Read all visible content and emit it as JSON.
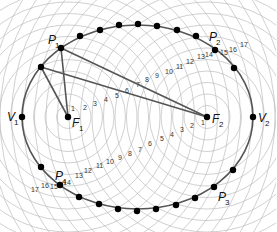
{
  "diagram": {
    "colors": {
      "circles": "#bcbcbc",
      "ellipse": "#555555",
      "lines": "#555555",
      "points": "#000000",
      "text": "#222222"
    },
    "ellipse": {
      "cx": 137.5,
      "cy": 117,
      "rx": 115.5,
      "ry": 92
    },
    "foci": [
      {
        "id": "F1",
        "letter": "F",
        "sub": "1",
        "x": 68,
        "y": 117
      },
      {
        "id": "F2",
        "letter": "F",
        "sub": "2",
        "x": 207,
        "y": 117
      }
    ],
    "vertices": [
      {
        "id": "V1",
        "letter": "V",
        "sub": "1",
        "x": 22,
        "y": 117
      },
      {
        "id": "V2",
        "letter": "V",
        "sub": "2",
        "x": 253,
        "y": 117
      }
    ],
    "circle_step": 11.5,
    "circle_count": 19,
    "labeled_points": [
      {
        "id": "P1",
        "letter": "P",
        "sub": "1",
        "x": 61,
        "y": 48,
        "lx": 48,
        "ly": 44
      },
      {
        "id": "P2",
        "letter": "P",
        "sub": "2",
        "x": 215,
        "y": 50,
        "lx": 209,
        "ly": 41
      },
      {
        "id": "P3",
        "letter": "P",
        "sub": "3",
        "x": 214,
        "y": 187,
        "lx": 218,
        "ly": 201
      },
      {
        "id": "P4",
        "letter": "P",
        "sub": "4",
        "x": 60,
        "y": 185,
        "lx": 55,
        "ly": 180
      }
    ],
    "other_points": [
      [
        41,
        67
      ],
      [
        80,
        36
      ],
      [
        100,
        30
      ],
      [
        119,
        25
      ],
      [
        138,
        24
      ],
      [
        157,
        26
      ],
      [
        177,
        30
      ],
      [
        196,
        36
      ],
      [
        234,
        68
      ],
      [
        233,
        170
      ],
      [
        195,
        198
      ],
      [
        176,
        205
      ],
      [
        156,
        209
      ],
      [
        137,
        211
      ],
      [
        118,
        209
      ],
      [
        99,
        204
      ],
      [
        79,
        197
      ],
      [
        41,
        167
      ]
    ],
    "lines": [
      {
        "from": "P1",
        "x1": 61,
        "y1": 48,
        "x2": 68,
        "y2": 117
      },
      {
        "from": "P1",
        "x1": 61,
        "y1": 48,
        "x2": 207,
        "y2": 117
      },
      {
        "from": "pt",
        "x1": 41,
        "y1": 67,
        "x2": 68,
        "y2": 117
      },
      {
        "from": "pt",
        "x1": 41,
        "y1": 67,
        "x2": 207,
        "y2": 117
      }
    ],
    "number_labels_upper": [
      {
        "t": "1",
        "x": 71,
        "y": 111
      },
      {
        "t": "2",
        "x": 83,
        "y": 110
      },
      {
        "t": "3",
        "x": 93,
        "y": 106
      },
      {
        "t": "4",
        "x": 104,
        "y": 102
      },
      {
        "t": "5",
        "x": 115,
        "y": 98
      },
      {
        "t": "6",
        "x": 125,
        "y": 93
      },
      {
        "t": "7",
        "x": 136,
        "y": 87
      },
      {
        "t": "8",
        "x": 145,
        "y": 82
      },
      {
        "t": "9",
        "x": 155,
        "y": 78
      },
      {
        "t": "10",
        "x": 165,
        "y": 74
      },
      {
        "t": "11",
        "x": 176,
        "y": 69
      },
      {
        "t": "12",
        "x": 186,
        "y": 64
      },
      {
        "t": "13",
        "x": 197,
        "y": 59
      },
      {
        "t": "14",
        "x": 205,
        "y": 57
      },
      {
        "t": "15",
        "x": 220,
        "y": 55
      },
      {
        "t": "16",
        "x": 229,
        "y": 52
      },
      {
        "t": "17",
        "x": 240,
        "y": 47
      }
    ],
    "number_labels_lower": [
      {
        "t": "1",
        "x": 201,
        "y": 125
      },
      {
        "t": "2",
        "x": 190,
        "y": 128
      },
      {
        "t": "3",
        "x": 180,
        "y": 132
      },
      {
        "t": "4",
        "x": 170,
        "y": 137
      },
      {
        "t": "5",
        "x": 160,
        "y": 141
      },
      {
        "t": "6",
        "x": 148,
        "y": 146
      },
      {
        "t": "7",
        "x": 138,
        "y": 152
      },
      {
        "t": "8",
        "x": 128,
        "y": 156
      },
      {
        "t": "9",
        "x": 118,
        "y": 160
      },
      {
        "t": "10",
        "x": 106,
        "y": 164
      },
      {
        "t": "11",
        "x": 96,
        "y": 168
      },
      {
        "t": "12",
        "x": 84,
        "y": 173
      },
      {
        "t": "13",
        "x": 75,
        "y": 178
      },
      {
        "t": "14",
        "x": 63,
        "y": 185
      },
      {
        "t": "15",
        "x": 50,
        "y": 189
      },
      {
        "t": "16",
        "x": 41,
        "y": 188
      },
      {
        "t": "17",
        "x": 31,
        "y": 192
      }
    ]
  }
}
